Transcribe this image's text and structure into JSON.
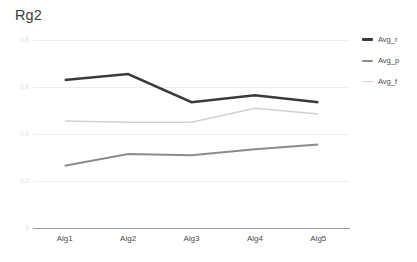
{
  "chart_data": {
    "type": "line",
    "title": "Rg2",
    "xlabel": "",
    "ylabel": "",
    "categories": [
      "Alg1",
      "Alg2",
      "Alg3",
      "Alg4",
      "Alg5"
    ],
    "series": [
      {
        "name": "Avg_r",
        "color": "#3a3a3a",
        "width": 2.6,
        "values": [
          0.63,
          0.655,
          0.535,
          0.565,
          0.535
        ]
      },
      {
        "name": "Avg_p",
        "color": "#8c8c8c",
        "width": 2.0,
        "values": [
          0.265,
          0.315,
          0.31,
          0.335,
          0.355
        ]
      },
      {
        "name": "Avg_f",
        "color": "#d2d2d2",
        "width": 1.5,
        "values": [
          0.455,
          0.45,
          0.45,
          0.51,
          0.485
        ]
      }
    ],
    "ylim": [
      0,
      0.8
    ],
    "y_ticks": [
      "0.8",
      "0.6",
      "0.4",
      "0.2",
      "0"
    ],
    "y_tick_values": [
      0.8,
      0.6,
      0.4,
      0.2,
      0
    ],
    "grid": true,
    "legend_position": "right",
    "legend": [
      "Avg_r",
      "Avg_p",
      "Avg_f"
    ],
    "axis_color": "#9a9a9a",
    "grid_color": "#ededed"
  },
  "legend": {
    "items": [
      {
        "label": "Avg_r"
      },
      {
        "label": "Avg_p"
      },
      {
        "label": "Avg_f"
      }
    ]
  }
}
